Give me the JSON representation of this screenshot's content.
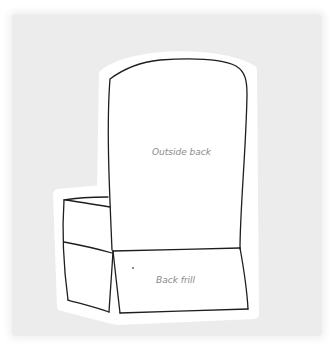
{
  "diagram": {
    "labels": {
      "outside_back": "Outside back",
      "back_frill": "Back frill"
    },
    "colors": {
      "background": "#ececec",
      "paper_halo": "#ffffff",
      "line": "#1e1e1e",
      "label": "#8a8a8a"
    }
  }
}
